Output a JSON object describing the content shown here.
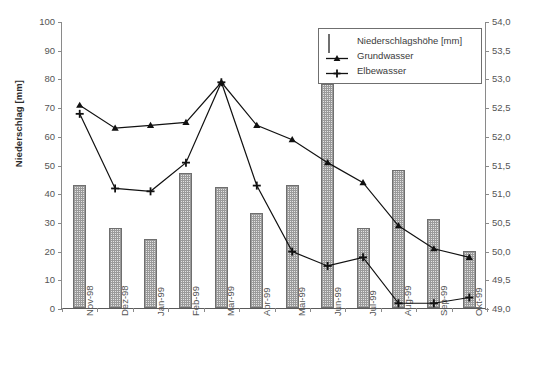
{
  "chart_data": {
    "type": "bar",
    "title": "",
    "categories": [
      "Nov-98",
      "Dez-98",
      "Jan-99",
      "Feb-99",
      "Mar-99",
      "Apr-99",
      "Mai-99",
      "Jun-99",
      "Jul-99",
      "Aug-99",
      "Sep-99",
      "Okt-99"
    ],
    "xlabel": "",
    "ylabel": "Niederschlag [mm]",
    "ylim": [
      0,
      100
    ],
    "yticks": [
      0,
      10,
      20,
      30,
      40,
      50,
      60,
      70,
      80,
      90,
      100
    ],
    "ytick_labels": [
      "0",
      "10",
      "20",
      "30",
      "40",
      "50",
      "60",
      "70",
      "80",
      "90",
      "100"
    ],
    "y2label": "Wasserspiegel [müNN]",
    "y2lim": [
      49.0,
      54.0
    ],
    "y2ticks": [
      49.0,
      49.5,
      50.0,
      50.5,
      51.0,
      51.5,
      52.0,
      52.5,
      53.0,
      53.5,
      54.0
    ],
    "y2tick_labels": [
      "49,0",
      "49,5",
      "50,0",
      "50,5",
      "51,0",
      "51,5",
      "52,0",
      "52,5",
      "53,0",
      "53,5",
      "54,0"
    ],
    "grid": false,
    "legend_position": "top-right",
    "series": [
      {
        "name": "Niederschlagshöhe [mm]",
        "type": "bar",
        "axis": "left",
        "values": [
          43,
          28,
          24,
          47,
          42,
          33,
          43,
          78,
          28,
          48,
          31,
          20
        ]
      },
      {
        "name": "Grundwasser",
        "type": "line",
        "marker": "triangle",
        "axis": "right",
        "values": [
          52.55,
          52.15,
          52.2,
          52.25,
          52.95,
          52.2,
          51.95,
          51.55,
          51.2,
          50.45,
          50.05,
          49.9
        ]
      },
      {
        "name": "Elbewasser",
        "type": "line",
        "marker": "plus",
        "axis": "right",
        "values": [
          52.4,
          51.1,
          51.05,
          51.55,
          52.95,
          51.15,
          50.0,
          49.75,
          49.9,
          49.1,
          49.1,
          49.2
        ]
      }
    ]
  },
  "legend": {
    "items": [
      {
        "label": "Niederschlagshöhe [mm]",
        "key": "bar-pattern-swatch"
      },
      {
        "label": "Grundwasser",
        "key": "line-triangle-marker"
      },
      {
        "label": "Elbewasser",
        "key": "line-plus-marker"
      }
    ]
  }
}
